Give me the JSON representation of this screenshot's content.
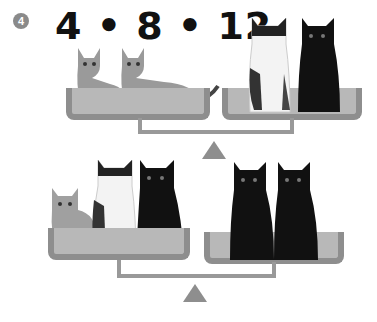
{
  "problem": {
    "number": "4",
    "title": "4 • 8 • 12"
  },
  "colors": {
    "badge": "#8a8a8a",
    "scale": "#8e8e8e",
    "pan_fill": "#b8b8b8",
    "text": "#111111"
  },
  "scales": [
    {
      "id": "top",
      "left_pan": [
        "tabby-kitten",
        "tabby-kitten"
      ],
      "right_pan": [
        "calico-cat",
        "black-cat"
      ]
    },
    {
      "id": "bottom",
      "left_pan": [
        "tabby-kitten",
        "calico-cat",
        "black-cat"
      ],
      "right_pan": [
        "black-cat",
        "black-cat"
      ]
    }
  ]
}
